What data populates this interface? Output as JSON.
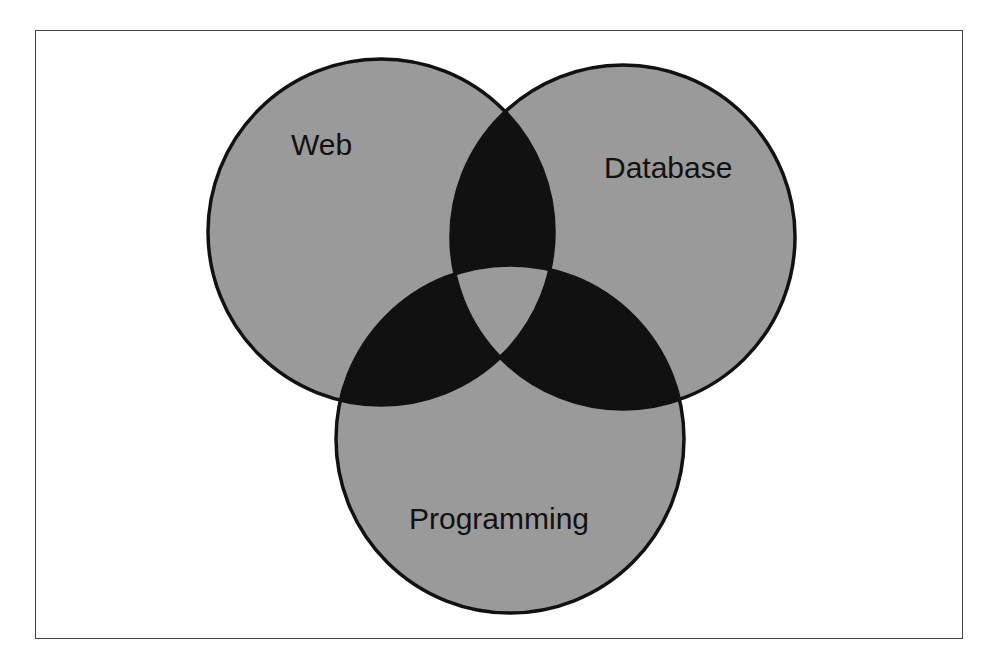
{
  "diagram": {
    "type": "venn",
    "sets": [
      {
        "id": "web",
        "label": "Web",
        "cx": 381,
        "cy": 232,
        "r": 173
      },
      {
        "id": "database",
        "label": "Database",
        "cx": 623,
        "cy": 237,
        "r": 172
      },
      {
        "id": "programming",
        "label": "Programming",
        "cx": 510,
        "cy": 439,
        "r": 174
      }
    ],
    "colors": {
      "single_region_fill": "#9a9a9a",
      "pairwise_intersection_fill": "#111111",
      "triple_intersection_fill": "#9a9a9a",
      "outline": "#111111",
      "frame_border": "#444444",
      "background": "#ffffff"
    }
  }
}
